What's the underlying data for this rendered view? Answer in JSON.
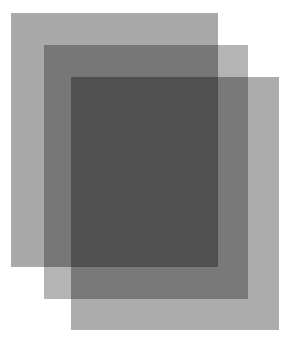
{
  "figure": {
    "background": "#ffffff",
    "sheets": [
      {
        "name": "back-sheet",
        "x": 11,
        "y": 13,
        "w": 207,
        "h": 254,
        "color": "#a9a9a9"
      },
      {
        "name": "middle-sheet",
        "x": 44,
        "y": 45,
        "w": 204,
        "h": 254,
        "color": "#b4b4b4"
      },
      {
        "name": "front-sheet",
        "x": 71,
        "y": 77,
        "w": 208,
        "h": 253,
        "color": "#acacac"
      }
    ]
  }
}
